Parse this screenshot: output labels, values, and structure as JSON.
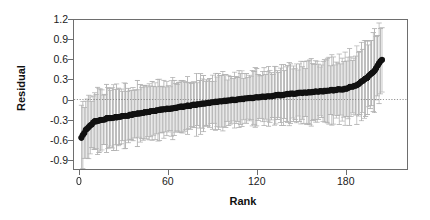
{
  "chart_data": {
    "type": "scatter",
    "title": "",
    "subtitle": "",
    "xlabel": "Rank",
    "ylabel": "Residual",
    "xlim": [
      -4,
      222
    ],
    "ylim": [
      -1.05,
      1.2
    ],
    "xticks": [
      0,
      60,
      120,
      180
    ],
    "xticklabels": [
      "0",
      "60",
      "120",
      "180"
    ],
    "yticks": [
      -0.9,
      -0.6,
      -0.3,
      0,
      0.3,
      0.6,
      0.9,
      1.2
    ],
    "yticklabels": [
      "-0.9",
      "-0.6",
      "-0.3",
      "0",
      "0.3",
      "0.6",
      "0.9",
      "1.2"
    ],
    "grid": false,
    "legend": null,
    "reference_line": {
      "y": 0,
      "style": "dotted",
      "color": "#777777"
    },
    "n_points": 205,
    "marker": {
      "shape": "circle",
      "color": "#111111",
      "size": 3.2
    },
    "errorbar": {
      "color": "#b4b4b4",
      "cap": true,
      "cap_width": 2.6,
      "level": "95%"
    },
    "series": [
      {
        "name": "Residual (ranked)",
        "x_start": 1,
        "x_end": 205,
        "point_estimates_summary": {
          "min": -0.58,
          "max": 0.6,
          "at_rank_1": -0.58,
          "at_rank_10": -0.33,
          "at_rank_30": -0.25,
          "at_rank_60": -0.14,
          "at_rank_90": -0.04,
          "at_rank_120": 0.03,
          "at_rank_150": 0.1,
          "at_rank_180": 0.16,
          "at_rank_195": 0.33,
          "at_rank_205": 0.6
        },
        "errorbar_halfwidth_summary": {
          "typical": 0.4,
          "at_rank_1": 0.43,
          "at_rank_100": 0.38,
          "at_rank_205": 0.55
        }
      }
    ]
  },
  "axes": {
    "y_label": "Residual",
    "x_label": "Rank",
    "y_ticklabels": [
      "1.2",
      "0.9",
      "0.6",
      "0.3",
      "0",
      "-0.3",
      "-0.6",
      "-0.9"
    ],
    "x_ticklabels": [
      "0",
      "60",
      "120",
      "180"
    ]
  },
  "colors": {
    "frame": "#6e6e6e",
    "marker": "#111111",
    "errorbar": "#b4b4b4",
    "reference_line": "#777777",
    "background": "#ffffff",
    "text": "#1a1a1a"
  }
}
